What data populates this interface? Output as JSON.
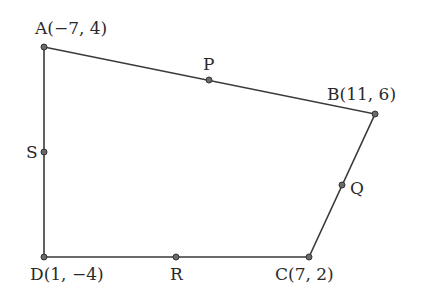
{
  "diagram": {
    "type": "quadrilateral-midpoints",
    "colors": {
      "stroke": "#3a3a3a",
      "point_fill": "#6a6a6a",
      "text": "#2a2a2a",
      "background": "#ffffff"
    },
    "vertices": [
      {
        "id": "A",
        "label": "A(−7, 4)",
        "coords": [
          -7,
          4
        ],
        "px": [
          44,
          47
        ]
      },
      {
        "id": "B",
        "label": "B(11, 6)",
        "coords": [
          11,
          6
        ],
        "px": [
          375,
          114
        ]
      },
      {
        "id": "C",
        "label": "C(7, 2)",
        "coords": [
          7,
          2
        ],
        "px": [
          309,
          257
        ]
      },
      {
        "id": "D",
        "label": "D(1, −4)",
        "coords": [
          1,
          -4
        ],
        "px": [
          44,
          257
        ]
      }
    ],
    "midpoints": [
      {
        "id": "P",
        "label": "P",
        "segment": "AB",
        "px": [
          209,
          80
        ]
      },
      {
        "id": "Q",
        "label": "Q",
        "segment": "BC",
        "px": [
          342,
          185
        ]
      },
      {
        "id": "R",
        "label": "R",
        "segment": "CD",
        "px": [
          176,
          257
        ]
      },
      {
        "id": "S",
        "label": "S",
        "segment": "DA",
        "px": [
          44,
          152
        ]
      }
    ],
    "edges": [
      [
        "A",
        "B"
      ],
      [
        "B",
        "C"
      ],
      [
        "C",
        "D"
      ],
      [
        "D",
        "A"
      ]
    ]
  }
}
